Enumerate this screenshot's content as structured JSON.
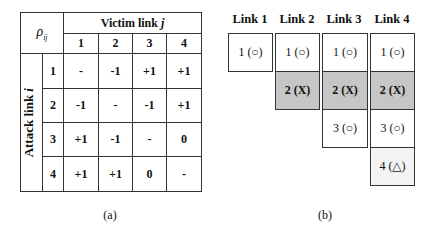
{
  "panel_a": {
    "corner_symbol": "ρ",
    "corner_subscript": "ij",
    "column_group_label": "Victim link ",
    "column_group_var": "j",
    "row_group_label": "Attack link ",
    "row_group_var": "i",
    "columns": [
      "1",
      "2",
      "3",
      "4"
    ],
    "rows": [
      {
        "label": "1",
        "cells": [
          "-",
          "-1",
          "+1",
          "+1"
        ]
      },
      {
        "label": "2",
        "cells": [
          "-1",
          "-",
          "-1",
          "+1"
        ]
      },
      {
        "label": "3",
        "cells": [
          "+1",
          "-1",
          "-",
          "0"
        ]
      },
      {
        "label": "4",
        "cells": [
          "+1",
          "+1",
          "0",
          "-"
        ]
      }
    ],
    "caption": "(a)"
  },
  "panel_b": {
    "links": [
      {
        "header": "Link 1",
        "slots": [
          {
            "text": "1 (○)",
            "style": "white"
          }
        ]
      },
      {
        "header": "Link 2",
        "slots": [
          {
            "text": "1 (○)",
            "style": "white"
          },
          {
            "text": "2 (X)",
            "style": "gray"
          }
        ]
      },
      {
        "header": "Link 3",
        "slots": [
          {
            "text": "1 (○)",
            "style": "white"
          },
          {
            "text": "2 (X)",
            "style": "gray"
          },
          {
            "text": "3 (○)",
            "style": "white"
          }
        ]
      },
      {
        "header": "Link 4",
        "slots": [
          {
            "text": "1 (○)",
            "style": "white"
          },
          {
            "text": "2 (X)",
            "style": "gray"
          },
          {
            "text": "3 (○)",
            "style": "white"
          },
          {
            "text": "4 (△)",
            "style": "light"
          }
        ]
      }
    ],
    "caption": "(b)"
  },
  "colors": {
    "gray_fill": "#c6c6c6",
    "light_fill": "#f3f3f3",
    "border": "#333333"
  }
}
